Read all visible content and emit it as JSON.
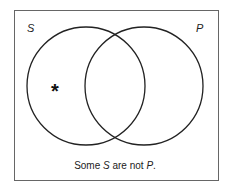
{
  "diagram": {
    "type": "venn",
    "sets": [
      {
        "label": "S",
        "position": "left"
      },
      {
        "label": "P",
        "position": "right"
      }
    ],
    "marker": {
      "symbol": "*",
      "region": "S only"
    },
    "caption": {
      "prefix": "Some ",
      "subject": "S",
      "middle": " are not ",
      "predicate": "P",
      "suffix": "."
    }
  }
}
